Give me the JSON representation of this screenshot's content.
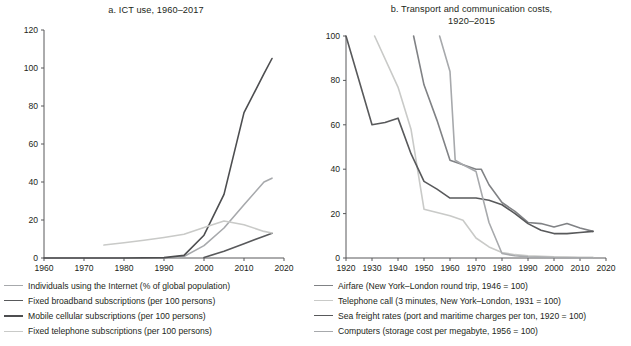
{
  "figure": {
    "width": 631,
    "height": 346,
    "background": "#ffffff",
    "text_color": "#231f20",
    "axis_color": "#58595b"
  },
  "palette": {
    "light_gray": "#c9cac8",
    "mid_light_gray": "#a7a9ac",
    "mid_gray": "#808285",
    "dark_gray": "#58595b",
    "darkest_gray": "#4d4e50"
  },
  "panel_a": {
    "title": "a. ICT use, 1960–2017",
    "legend": [
      {
        "label": "Individuals using the Internet (% of global population)",
        "color": "#a7a9ac",
        "width": 1.6
      },
      {
        "label": "Fixed broadband subscriptions (per 100 persons)",
        "color": "#58595b",
        "width": 1.9
      },
      {
        "label": "Mobile cellular subscriptions (per 100 persons)",
        "color": "#4d4e50",
        "width": 2.1
      },
      {
        "label": "Fixed telephone subscriptions (per 100 persons)",
        "color": "#c9cac8",
        "width": 1.6
      }
    ]
  },
  "panel_b": {
    "title_line1": "b. Transport and communication costs,",
    "title_line2": "1920–2015",
    "legend": [
      {
        "label": "Airfare (New York–London round trip, 1946 = 100)",
        "color": "#808285",
        "width": 1.8
      },
      {
        "label": "Telephone call (3 minutes, New York–London, 1931 = 100)",
        "color": "#c9cac8",
        "width": 1.6
      },
      {
        "label": "Sea freight rates (port and maritime charges per ton, 1920 = 100)",
        "color": "#58595b",
        "width": 1.9
      },
      {
        "label": "Computers (storage cost per megabyte, 1956 = 100)",
        "color": "#a7a9ac",
        "width": 1.6
      }
    ]
  },
  "chart_data": [
    {
      "id": "panel-a",
      "type": "line",
      "title": "a. ICT use, 1960–2017",
      "xlabel": "",
      "ylabel": "",
      "xlim": [
        1960,
        2020
      ],
      "ylim": [
        0,
        120
      ],
      "xticks": [
        1960,
        1970,
        1980,
        1990,
        2000,
        2010,
        2020
      ],
      "yticks": [
        0,
        20,
        40,
        60,
        80,
        100,
        120
      ],
      "xtick_labels": [
        "1960",
        "1970",
        "1980",
        "1990",
        "2000",
        "2010",
        "2020"
      ],
      "ytick_labels": [
        "0",
        "20",
        "40",
        "60",
        "80",
        "100",
        "120"
      ],
      "grid": false,
      "legend_position": "below",
      "series": [
        {
          "name": "Individuals using the Internet (% of global population)",
          "color": "#a7a9ac",
          "x": [
            1990,
            1995,
            2000,
            2005,
            2010,
            2015,
            2017
          ],
          "values": [
            0,
            0.8,
            6.5,
            15.8,
            28.0,
            40.0,
            42.0
          ]
        },
        {
          "name": "Fixed broadband subscriptions (per 100 persons)",
          "color": "#58595b",
          "x": [
            2000,
            2005,
            2010,
            2015,
            2017
          ],
          "values": [
            0.3,
            3.5,
            7.5,
            11.5,
            13.0
          ]
        },
        {
          "name": "Mobile cellular subscriptions (per 100 persons)",
          "color": "#4d4e50",
          "x": [
            1960,
            1980,
            1990,
            1995,
            2000,
            2005,
            2010,
            2015,
            2017
          ],
          "values": [
            0,
            0,
            0.2,
            1.4,
            12.0,
            33.5,
            76.5,
            97.0,
            105.0
          ]
        },
        {
          "name": "Fixed telephone subscriptions (per 100 persons)",
          "color": "#c9cac8",
          "x": [
            1975,
            1980,
            1985,
            1990,
            1995,
            2000,
            2005,
            2010,
            2015,
            2017
          ],
          "values": [
            6.8,
            8.0,
            9.3,
            10.8,
            12.5,
            16.0,
            19.5,
            17.5,
            14.0,
            13.2
          ]
        }
      ]
    },
    {
      "id": "panel-b",
      "type": "line",
      "title": "b. Transport and communication costs, 1920–2015",
      "xlabel": "",
      "ylabel": "",
      "xlim": [
        1920,
        2020
      ],
      "ylim": [
        0,
        100
      ],
      "xticks": [
        1920,
        1930,
        1940,
        1950,
        1960,
        1970,
        1980,
        1990,
        2000,
        2010,
        2020
      ],
      "yticks": [
        0,
        20,
        40,
        60,
        80,
        100
      ],
      "xtick_labels": [
        "1920",
        "1930",
        "1940",
        "1950",
        "1960",
        "1970",
        "1980",
        "1990",
        "2000",
        "2010",
        "2020"
      ],
      "ytick_labels": [
        "0",
        "20",
        "40",
        "60",
        "80",
        "100"
      ],
      "grid": false,
      "legend_position": "below",
      "series": [
        {
          "name": "Airfare (New York–London round trip, 1946 = 100)",
          "color": "#808285",
          "x": [
            1946,
            1950,
            1955,
            1960,
            1965,
            1970,
            1972,
            1975,
            1980,
            1985,
            1990,
            1995,
            2000,
            2005,
            2010,
            2015
          ],
          "values": [
            100,
            78,
            62,
            44,
            42,
            40,
            40,
            33,
            25,
            21,
            16,
            15.5,
            14,
            15.5,
            13.5,
            12
          ]
        },
        {
          "name": "Telephone call (3 minutes, New York–London, 1931 = 100)",
          "color": "#c9cac8",
          "x": [
            1931,
            1940,
            1945,
            1950,
            1955,
            1960,
            1965,
            1970,
            1975,
            1980,
            1985,
            1990,
            2000,
            2010,
            2015
          ],
          "values": [
            100,
            77,
            58,
            22,
            20.5,
            19,
            17,
            9,
            5,
            2.5,
            1.5,
            1,
            0.5,
            0.3,
            0.3
          ]
        },
        {
          "name": "Sea freight rates (port and maritime charges per ton, 1920 = 100)",
          "color": "#58595b",
          "x": [
            1920,
            1930,
            1935,
            1940,
            1945,
            1950,
            1955,
            1960,
            1970,
            1975,
            1980,
            1985,
            1990,
            1995,
            2000,
            2005,
            2010,
            2015
          ],
          "values": [
            100,
            60,
            61,
            63,
            47,
            34.5,
            31,
            27,
            27,
            26,
            24,
            20,
            15.5,
            12.5,
            11,
            11,
            11.5,
            12
          ]
        },
        {
          "name": "Computers (storage cost per megabyte, 1956 = 100)",
          "color": "#a7a9ac",
          "x": [
            1956,
            1960,
            1962,
            1965,
            1970,
            1975,
            1980,
            1985,
            1990,
            2000,
            2010,
            2015
          ],
          "values": [
            100,
            84,
            44,
            42,
            39,
            16,
            2,
            1,
            0.5,
            0.2,
            0.1,
            0.1
          ]
        }
      ]
    }
  ]
}
